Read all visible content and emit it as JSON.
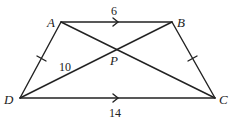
{
  "diagram": {
    "type": "trapezoid",
    "points": {
      "A": {
        "label": "A",
        "x": 61,
        "y": 22
      },
      "B": {
        "label": "B",
        "x": 172,
        "y": 22
      },
      "C": {
        "label": "C",
        "x": 215,
        "y": 98
      },
      "D": {
        "label": "D",
        "x": 20,
        "y": 98
      },
      "P": {
        "label": "P",
        "x": 117,
        "y": 49
      }
    },
    "segments": [
      "AB",
      "BC",
      "CD",
      "DA",
      "AC",
      "BD"
    ],
    "measures": {
      "AB": "6",
      "DC": "14",
      "DP": "10"
    },
    "parallel_marks": [
      "AB",
      "DC"
    ],
    "congruent_marks": [
      "AD",
      "BC"
    ],
    "colors": {
      "stroke": "#222222",
      "background": "#ffffff"
    }
  }
}
